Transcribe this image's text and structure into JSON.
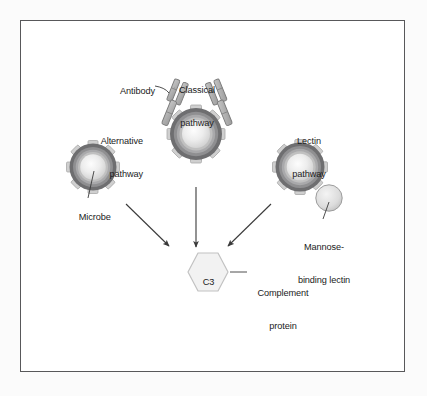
{
  "figure": {
    "type": "biology-diagram",
    "labels": {
      "antibody": "Antibody",
      "classical_pathway_line1": "Classical",
      "classical_pathway_line2": "pathway",
      "alternative_pathway_line1": "Alternative",
      "alternative_pathway_line2": "pathway",
      "lectin_pathway_line1": "Lectin",
      "lectin_pathway_line2": "pathway",
      "microbe": "Microbe",
      "mannose_binding_lectin_line1": "Mannose-",
      "mannose_binding_lectin_line2": "binding lectin",
      "complement_protein_line1": "Complement",
      "complement_protein_line2": "protein",
      "c3": "C3"
    },
    "colors": {
      "page_background": "#fbfbfb",
      "frame_border": "#58585a",
      "frame_background": "#ffffff",
      "microbe_outer_ring": "#6e6e70",
      "microbe_mid_ring": "#9a9a9c",
      "microbe_inner_ring": "#c2c2c2",
      "microbe_core": "#ebebeb",
      "spike_fill": "#cfcfcf",
      "spike_stroke": "#a8a8a8",
      "antibody_fill": "#b4b4b4",
      "antibody_stroke": "#7b7b7b",
      "lectin_fill": "#d6d6d6",
      "lectin_stroke": "#9d9d9d",
      "hexagon_fill": "#f2f2f2",
      "hexagon_stroke": "#b9b9b9",
      "arrow_color": "#3a3a3a",
      "leader_color": "#3a3a3a",
      "text_color": "#1b1b1b"
    },
    "elements": [
      {
        "name": "alternative-pathway-microbe",
        "cx": 92,
        "cy": 166,
        "r": 24
      },
      {
        "name": "classical-pathway-microbe",
        "cx": 195,
        "cy": 133,
        "r": 27
      },
      {
        "name": "lectin-pathway-microbe",
        "cx": 299,
        "cy": 166,
        "r": 25
      },
      {
        "name": "mannose-binding-lectin",
        "cx": 328,
        "cy": 197,
        "r": 13
      },
      {
        "name": "c3-hexagon",
        "cx": 197,
        "cy": 271,
        "r": 28
      }
    ],
    "arrows": [
      {
        "name": "alternative-to-c3",
        "x1": 125,
        "y1": 203,
        "x2": 168,
        "y2": 245
      },
      {
        "name": "classical-to-c3",
        "x1": 195,
        "y1": 186,
        "x2": 195,
        "y2": 245
      },
      {
        "name": "lectin-to-c3",
        "x1": 270,
        "y1": 203,
        "x2": 227,
        "y2": 245
      }
    ]
  }
}
